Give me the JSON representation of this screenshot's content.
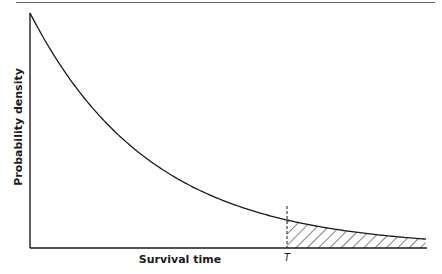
{
  "figure": {
    "y_axis_label": "Probability density",
    "x_axis_label": "Survival time",
    "marker_label": "T"
  },
  "chart_data": {
    "type": "line",
    "title": "",
    "xlabel": "Survival time",
    "ylabel": "Probability density",
    "grid": false,
    "legend": null,
    "series": [
      {
        "name": "f(t)",
        "shape": "exponential decay",
        "x_norm": [
          0.0,
          0.1,
          0.2,
          0.3,
          0.4,
          0.5,
          0.6,
          0.65,
          0.7,
          0.8,
          0.9,
          1.0
        ],
        "y_norm": [
          1.0,
          0.7,
          0.49,
          0.35,
          0.24,
          0.17,
          0.12,
          0.1,
          0.083,
          0.058,
          0.041,
          0.029
        ]
      }
    ],
    "annotations": [
      {
        "type": "vertical-dashed-line",
        "x_norm": 0.65,
        "label": "T"
      },
      {
        "type": "hatched-area",
        "from_x_norm": 0.65,
        "to_x_norm": 1.0,
        "meaning": "P(survival time > T)"
      }
    ],
    "ticks": {
      "x": [],
      "y": []
    }
  },
  "style": {
    "ink": "#1a1a1a",
    "rule": "#555555",
    "background": "#ffffff"
  }
}
